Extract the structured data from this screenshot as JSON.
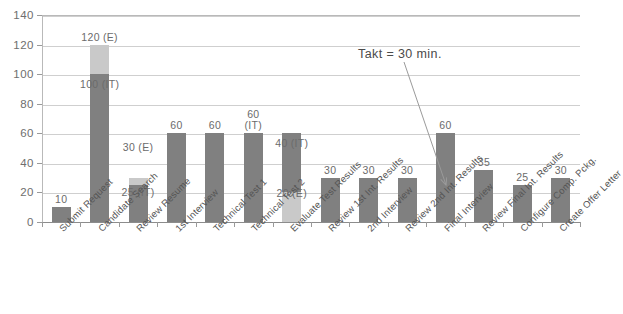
{
  "chart_data": {
    "type": "bar",
    "title": "",
    "xlabel": "",
    "ylabel": "",
    "ylim": [
      0,
      140
    ],
    "ytick_step": 20,
    "yticks": [
      "0",
      "20",
      "40",
      "60",
      "80",
      "100",
      "120",
      "140"
    ],
    "grid": true,
    "legend": "none",
    "stacked": true,
    "colors": {
      "it": "#808080",
      "e": "#c9c9c9",
      "grid": "#cfcfcf",
      "axis": "#8c8c8c",
      "text": "#5a5a5a"
    },
    "categories": [
      "Submit Request",
      "Candidate Search",
      "Review Resume",
      "1st Interview",
      "Technical Test 1",
      "Technical Test 2",
      "Evaluate Test Results",
      "Review 1st Int. Results",
      "2nd Interview",
      "Review 2nd Int. Results",
      "Final Interview",
      "Review Final Int. Results",
      "Configure Comp. Pckg.",
      "Create Offer Letter"
    ],
    "series": [
      {
        "name": "IT",
        "values": [
          10,
          100,
          25,
          60,
          60,
          60,
          40,
          30,
          30,
          30,
          60,
          35,
          25,
          30
        ]
      },
      {
        "name": "E",
        "values": [
          0,
          20,
          5,
          0,
          0,
          0,
          20,
          0,
          0,
          0,
          0,
          0,
          0,
          0
        ]
      }
    ],
    "totals": [
      10,
      120,
      30,
      60,
      60,
      60,
      60,
      30,
      30,
      30,
      60,
      35,
      25,
      30
    ],
    "bar_labels": [
      {
        "index": 0,
        "text": "10",
        "value": 10,
        "at": 10,
        "placement": "above"
      },
      {
        "index": 1,
        "text": "120 (E)",
        "value": 120,
        "at": 120,
        "placement": "above"
      },
      {
        "index": 1,
        "text": "100 (IT)",
        "value": 100,
        "at": 88,
        "placement": "inside"
      },
      {
        "index": 2,
        "text": "30 (E)",
        "value": 30,
        "at": 45,
        "placement": "above"
      },
      {
        "index": 2,
        "text": "25 (IT)",
        "value": 25,
        "at": 15,
        "placement": "inside"
      },
      {
        "index": 3,
        "text": "60",
        "value": 60,
        "at": 60,
        "placement": "above"
      },
      {
        "index": 4,
        "text": "60",
        "value": 60,
        "at": 60,
        "placement": "above"
      },
      {
        "index": 5,
        "text": "60\n(IT)",
        "value": 60,
        "at": 60,
        "placement": "above"
      },
      {
        "index": 6,
        "text": "40 (IT)",
        "value": 40,
        "at": 48,
        "placement": "above"
      },
      {
        "index": 6,
        "text": "20 (E)",
        "value": 20,
        "at": 14,
        "placement": "inside"
      },
      {
        "index": 7,
        "text": "30",
        "value": 30,
        "at": 30,
        "placement": "above"
      },
      {
        "index": 8,
        "text": "30",
        "value": 30,
        "at": 30,
        "placement": "above"
      },
      {
        "index": 9,
        "text": "30",
        "value": 30,
        "at": 30,
        "placement": "above"
      },
      {
        "index": 10,
        "text": "60",
        "value": 60,
        "at": 60,
        "placement": "above"
      },
      {
        "index": 11,
        "text": "35",
        "value": 35,
        "at": 35,
        "placement": "above"
      },
      {
        "index": 12,
        "text": "25",
        "value": 25,
        "at": 25,
        "placement": "above"
      },
      {
        "index": 13,
        "text": "30",
        "value": 30,
        "at": 30,
        "placement": "above"
      }
    ],
    "annotations": [
      {
        "name": "takt-annotation",
        "text": "Takt = 30 min.",
        "x": 358,
        "y": 47,
        "arrow": {
          "from_x": 404,
          "from_y": 62,
          "to_x": 446,
          "to_y": 185
        }
      }
    ]
  }
}
